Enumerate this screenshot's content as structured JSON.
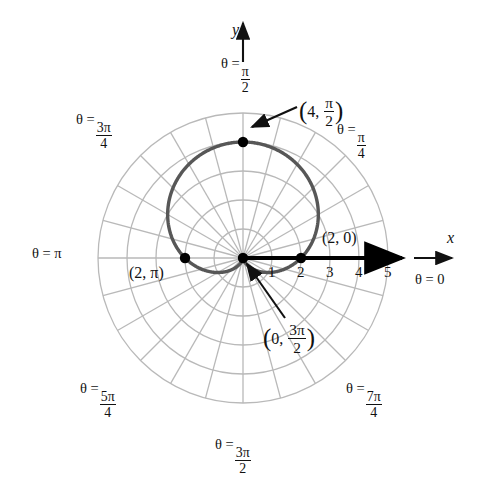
{
  "figure": {
    "type": "polar-plot",
    "curve_equation": "r = 2(1 + sin(theta))",
    "curve_color": "#575757",
    "grid_color": "#b9b9b9",
    "axis_color": "#000000"
  },
  "axes": {
    "x_label": "x",
    "y_label": "y",
    "theta_zero_label": "θ = 0"
  },
  "radial_ticks": [
    {
      "value": "1"
    },
    {
      "value": "2"
    },
    {
      "value": "3"
    },
    {
      "value": "4"
    },
    {
      "value": "5"
    }
  ],
  "angle_labels": [
    {
      "id": "pi-over-2",
      "prefix": "θ =",
      "num": "π",
      "den": "2",
      "style": "fraction"
    },
    {
      "id": "pi-over-4",
      "prefix": "θ =",
      "num": "π",
      "den": "4",
      "style": "fraction"
    },
    {
      "id": "3pi-over-4",
      "prefix": "θ =",
      "num": "3π",
      "den": "4",
      "style": "fraction"
    },
    {
      "id": "pi",
      "prefix": "θ =",
      "num": "π",
      "den": "",
      "style": "plain",
      "text": "θ = π"
    },
    {
      "id": "5pi-over-4",
      "prefix": "θ =",
      "num": "5π",
      "den": "4",
      "style": "fraction"
    },
    {
      "id": "3pi-over-2",
      "prefix": "θ =",
      "num": "3π",
      "den": "2",
      "style": "fraction"
    },
    {
      "id": "7pi-over-4",
      "prefix": "θ =",
      "num": "7π",
      "den": "4",
      "style": "fraction"
    },
    {
      "id": "zero",
      "prefix": "θ =",
      "num": "0",
      "den": "",
      "style": "plain",
      "text": "θ = 0"
    }
  ],
  "points": [
    {
      "id": "top",
      "r": 4,
      "theta_text": "π/2",
      "label_r": "4",
      "label_num": "π",
      "label_den": "2",
      "has_leader": true
    },
    {
      "id": "right",
      "r": 2,
      "theta_text": "0",
      "label_text": "(2, 0)",
      "has_leader": false
    },
    {
      "id": "left",
      "r": 2,
      "theta_text": "π",
      "label_text": "(2, π)",
      "has_leader": false
    },
    {
      "id": "cusp",
      "r": 0,
      "theta_text": "3π/2",
      "label_r": "0",
      "label_num": "3π",
      "label_den": "2",
      "has_leader": true
    }
  ],
  "chart_data": {
    "type": "line",
    "title": "",
    "xlabel": "x",
    "ylabel": "y",
    "coordinate_system": "polar",
    "equation": "r = 2(1 + sin(theta))",
    "curve_name": "cardioid",
    "radial_ticks": [
      1,
      2,
      3,
      4,
      5
    ],
    "radial_max": 5,
    "angular_gridline_step_rad": 0.2617993878,
    "angular_gridline_count": 24,
    "labeled_angles_rad": [
      0,
      0.7853981634,
      1.5707963268,
      2.3561944902,
      3.1415926536,
      3.926990817,
      4.7123889804,
      5.4977871438
    ],
    "labeled_angles_text": [
      "θ = 0",
      "θ = π/4",
      "θ = π/2",
      "θ = 3π/4",
      "θ = π",
      "θ = 5π/4",
      "θ = 3π/2",
      "θ = 7π/4"
    ],
    "marked_points": [
      {
        "r": 4,
        "theta": 1.5707963268,
        "label": "(4, π/2)"
      },
      {
        "r": 2,
        "theta": 0,
        "label": "(2, 0)"
      },
      {
        "r": 2,
        "theta": 3.1415926536,
        "label": "(2, π)"
      },
      {
        "r": 0,
        "theta": 4.7123889804,
        "label": "(0, 3π/2)"
      }
    ],
    "grid": true,
    "legend": "none"
  }
}
